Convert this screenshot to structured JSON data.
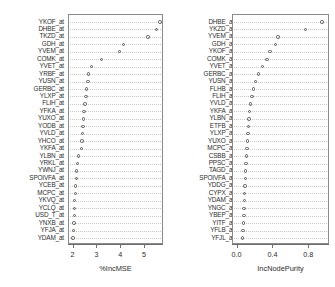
{
  "figure": {
    "type": "variable-importance-dotchart",
    "panel_count": 2
  },
  "panels": [
    {
      "id": "incmse",
      "axis_title": "%IncMSE",
      "ticks": [
        "2",
        "3",
        "4",
        "5"
      ],
      "tick_values": [
        2,
        3,
        4,
        5
      ],
      "xlim": [
        1.85,
        5.75
      ],
      "labels": [
        "YKOF_at",
        "DHBE_at",
        "TKZD_at",
        "GDH_at",
        "YVEM_at",
        "COMK_at",
        "YVET_at",
        "YRBF_at",
        "YUSN_at",
        "GERBC_at",
        "YLXP_at",
        "FLIH_at",
        "YFKA_at",
        "YUXO_at",
        "YODB_at",
        "YVLD_at",
        "YHCO_at",
        "YKFA_at",
        "YLBN_at",
        "YRKL_at",
        "YWNJ_at",
        "SPOIVFA_at",
        "YCEB_at",
        "MCPC_at",
        "YKVQ_at",
        "YCLQ_at",
        "USD_T_at",
        "YNXB_at",
        "YFJA_at",
        "YDAM_at"
      ],
      "values": [
        5.62,
        5.48,
        5.12,
        4.1,
        3.92,
        3.18,
        2.76,
        2.62,
        2.6,
        2.55,
        2.52,
        2.48,
        2.44,
        2.42,
        2.4,
        2.38,
        2.36,
        2.34,
        2.2,
        2.16,
        2.13,
        2.11,
        2.09,
        2.07,
        2.05,
        2.04,
        2.03,
        2.01,
        2.0,
        1.98
      ]
    },
    {
      "id": "incnodepurity",
      "axis_title": "IncNodePurity",
      "ticks": [
        "0.0",
        "0.4",
        "0.8"
      ],
      "tick_values": [
        0.0,
        0.4,
        0.8
      ],
      "xlim": [
        -0.04,
        1.02
      ],
      "labels": [
        "DHBE_at",
        "YKZD_at",
        "YVEM_at",
        "GDH_at",
        "YKOF_at",
        "COMK_at",
        "YVET_at",
        "GERBC_at",
        "YUSN_at",
        "FLHB_at",
        "FLIH_at",
        "YVLD_at",
        "YKFA_at",
        "YLBN_at",
        "ETFB_at",
        "YLXP_at",
        "YUXO_at",
        "MCPC_at",
        "CSBB_at",
        "PPSC_at",
        "TAGD_at",
        "SPOIVFA_at",
        "YDDG_at",
        "CYPX_at",
        "YDAM_at",
        "YNGC_at",
        "YBEP_at",
        "YITF_at",
        "YFLB_at",
        "YFJL_at"
      ],
      "values": [
        0.94,
        0.76,
        0.45,
        0.42,
        0.36,
        0.33,
        0.28,
        0.23,
        0.2,
        0.18,
        0.16,
        0.145,
        0.135,
        0.128,
        0.122,
        0.118,
        0.112,
        0.105,
        0.098,
        0.092,
        0.088,
        0.085,
        0.082,
        0.079,
        0.076,
        0.073,
        0.07,
        0.066,
        0.062,
        0.058
      ]
    }
  ],
  "chart_data": {
    "type": "scatter",
    "title": "",
    "subtitle": "",
    "legend": [],
    "grid": true,
    "charts": [
      {
        "id": "incmse",
        "type": "scatter",
        "orientation": "horizontal-dotchart",
        "xlabel": "%IncMSE",
        "ylabel": "",
        "xlim": [
          1.85,
          5.75
        ],
        "xticks": [
          2,
          3,
          4,
          5
        ],
        "xticklabels": [
          "2",
          "3",
          "4",
          "5"
        ],
        "categories": [
          "YKOF_at",
          "DHBE_at",
          "TKZD_at",
          "GDH_at",
          "YVEM_at",
          "COMK_at",
          "YVET_at",
          "YRBF_at",
          "YUSN_at",
          "GERBC_at",
          "YLXP_at",
          "FLIH_at",
          "YFKA_at",
          "YUXO_at",
          "YODB_at",
          "YVLD_at",
          "YHCO_at",
          "YKFA_at",
          "YLBN_at",
          "YRKL_at",
          "YWNJ_at",
          "SPOIVFA_at",
          "YCEB_at",
          "MCPC_at",
          "YKVQ_at",
          "YCLQ_at",
          "USD_T_at",
          "YNXB_at",
          "YFJA_at",
          "YDAM_at"
        ],
        "values": [
          5.62,
          5.48,
          5.12,
          4.1,
          3.92,
          3.18,
          2.76,
          2.62,
          2.6,
          2.55,
          2.52,
          2.48,
          2.44,
          2.42,
          2.4,
          2.38,
          2.36,
          2.34,
          2.2,
          2.16,
          2.13,
          2.11,
          2.09,
          2.07,
          2.05,
          2.04,
          2.03,
          2.01,
          2.0,
          1.98
        ]
      },
      {
        "id": "incnodepurity",
        "type": "scatter",
        "orientation": "horizontal-dotchart",
        "xlabel": "IncNodePurity",
        "ylabel": "",
        "xlim": [
          -0.04,
          1.02
        ],
        "xticks": [
          0.0,
          0.4,
          0.8
        ],
        "xticklabels": [
          "0.0",
          "0.4",
          "0.8"
        ],
        "categories": [
          "DHBE_at",
          "YKZD_at",
          "YVEM_at",
          "GDH_at",
          "YKOF_at",
          "COMK_at",
          "YVET_at",
          "GERBC_at",
          "YUSN_at",
          "FLHB_at",
          "FLIH_at",
          "YVLD_at",
          "YKFA_at",
          "YLBN_at",
          "ETFB_at",
          "YLXP_at",
          "YUXO_at",
          "MCPC_at",
          "CSBB_at",
          "PPSC_at",
          "TAGD_at",
          "SPOIVFA_at",
          "YDDG_at",
          "CYPX_at",
          "YDAM_at",
          "YNGC_at",
          "YBEP_at",
          "YITF_at",
          "YFLB_at",
          "YFJL_at"
        ],
        "values": [
          0.94,
          0.76,
          0.45,
          0.42,
          0.36,
          0.33,
          0.28,
          0.23,
          0.2,
          0.18,
          0.16,
          0.145,
          0.135,
          0.128,
          0.122,
          0.118,
          0.112,
          0.105,
          0.098,
          0.092,
          0.088,
          0.085,
          0.082,
          0.079,
          0.076,
          0.073,
          0.07,
          0.066,
          0.062,
          0.058
        ]
      }
    ]
  }
}
